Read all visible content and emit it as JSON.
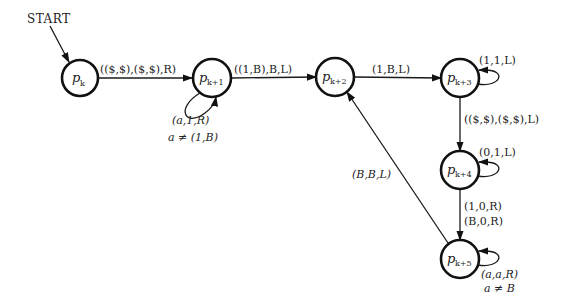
{
  "diagram": {
    "type": "state-transition-diagram",
    "start_label": "START",
    "nodes": [
      {
        "id": "pk",
        "base": "p",
        "sub": "k",
        "cx": 80,
        "cy": 78
      },
      {
        "id": "pk1",
        "base": "p",
        "sub": "k+1",
        "cx": 212,
        "cy": 78
      },
      {
        "id": "pk2",
        "base": "p",
        "sub": "k+2",
        "cx": 335,
        "cy": 77
      },
      {
        "id": "pk3",
        "base": "p",
        "sub": "k+3",
        "cx": 460,
        "cy": 78
      },
      {
        "id": "pk4",
        "base": "p",
        "sub": "k+4",
        "cx": 460,
        "cy": 170
      },
      {
        "id": "pk5",
        "base": "p",
        "sub": "k+5",
        "cx": 460,
        "cy": 259
      }
    ],
    "edges": [
      {
        "from": "pk",
        "to": "pk1",
        "label": "(($,$),($,$),R)"
      },
      {
        "from": "pk1",
        "to": "pk1",
        "label": "(a,1,R)",
        "condition": "a ≠ (1,B)"
      },
      {
        "from": "pk1",
        "to": "pk2",
        "label": "((1,B),B,L)"
      },
      {
        "from": "pk2",
        "to": "pk3",
        "label": "(1,B,L)"
      },
      {
        "from": "pk3",
        "to": "pk3",
        "label": "(1,1,L)"
      },
      {
        "from": "pk3",
        "to": "pk4",
        "label": "(($,$),($,$),L)"
      },
      {
        "from": "pk4",
        "to": "pk4",
        "label": "(0,1,L)"
      },
      {
        "from": "pk4",
        "to": "pk5",
        "label": "(1,0,R)",
        "label2": "(B,0,R)"
      },
      {
        "from": "pk5",
        "to": "pk5",
        "label": "(a,a,R)",
        "condition": "a ≠ B"
      },
      {
        "from": "pk5",
        "to": "pk2",
        "label": "(B,B,L)"
      }
    ]
  }
}
